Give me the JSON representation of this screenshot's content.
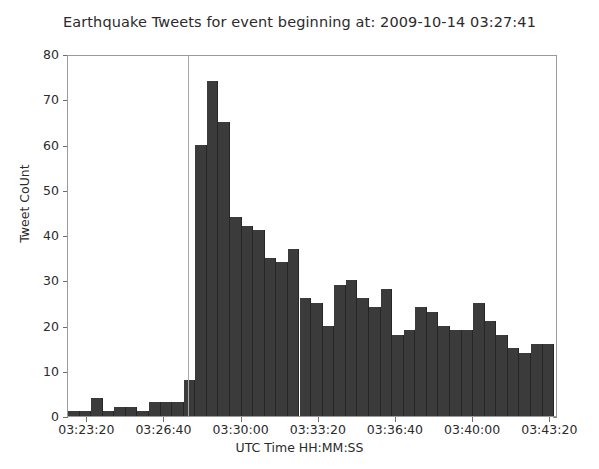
{
  "figure": {
    "title": "Earthquake Tweets for event beginning at: 2009-10-14 03:27:41",
    "xlabel": "UTC Time HH:MM:SS",
    "ylabel": "Tweet CoUnt",
    "bar_color": "#3b3b3b",
    "bar_edge_color": "#262626",
    "marker_color": "#a7a7a7",
    "axis_color": "#9a9a9a",
    "background_color": "#ffffff"
  },
  "chart_data": {
    "type": "bar",
    "title": "Earthquake Tweets for event beginning at: 2009-10-14 03:27:41",
    "xlabel": "UTC Time HH:MM:SS",
    "ylabel": "Tweet CoUnt",
    "xlim": [
      "03:22:30",
      "03:43:40"
    ],
    "ylim": [
      0,
      80
    ],
    "yticks": [
      0,
      10,
      20,
      30,
      40,
      50,
      60,
      70,
      80
    ],
    "ytick_labels": [
      "0",
      "10",
      "20",
      "30",
      "40",
      "50",
      "60",
      "70",
      "80"
    ],
    "xticks": [
      "03:23:20",
      "03:26:40",
      "03:30:00",
      "03:33:20",
      "03:36:40",
      "03:40:00",
      "03:43:20"
    ],
    "xtick_labels": [
      "03:23:20",
      "03:26:40",
      "03:30:00",
      "03:33:20",
      "03:36:40",
      "03:40:00",
      "03:43:20"
    ],
    "grid": false,
    "legend": null,
    "bin_seconds": 30,
    "annotations": [
      {
        "type": "vline",
        "label": "event-start",
        "x": "03:27:41",
        "color": "#a7a7a7"
      }
    ],
    "categories": [
      "03:22:30",
      "03:23:00",
      "03:23:30",
      "03:24:00",
      "03:24:30",
      "03:25:00",
      "03:25:30",
      "03:26:00",
      "03:26:30",
      "03:27:00",
      "03:27:30",
      "03:28:00",
      "03:28:30",
      "03:29:00",
      "03:29:30",
      "03:30:00",
      "03:30:30",
      "03:31:00",
      "03:31:30",
      "03:32:00",
      "03:32:30",
      "03:33:00",
      "03:33:30",
      "03:34:00",
      "03:34:30",
      "03:35:00",
      "03:35:30",
      "03:36:00",
      "03:36:30",
      "03:37:00",
      "03:37:30",
      "03:38:00",
      "03:38:30",
      "03:39:00",
      "03:39:30",
      "03:40:00",
      "03:40:30",
      "03:41:00",
      "03:41:30",
      "03:42:00",
      "03:42:30",
      "03:43:00"
    ],
    "values": [
      1,
      1,
      4,
      1,
      2,
      2,
      1,
      3,
      3,
      3,
      8,
      60,
      74,
      65,
      44,
      42,
      41,
      35,
      34,
      37,
      26,
      25,
      20,
      29,
      30,
      26,
      24,
      28,
      18,
      19,
      24,
      23,
      20,
      19,
      19,
      25,
      21,
      18,
      15,
      14,
      16,
      16
    ]
  }
}
